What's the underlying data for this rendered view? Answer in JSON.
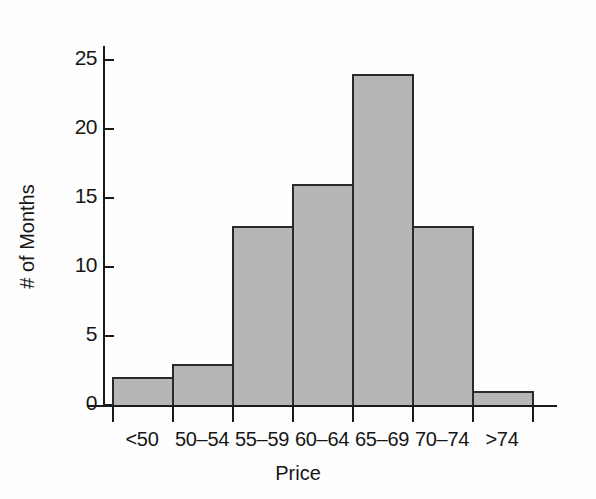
{
  "chart_data": {
    "type": "bar",
    "title": "",
    "subtitle": "",
    "xlabel": "Price",
    "ylabel": "# of Months",
    "categories": [
      "<50",
      "50–54",
      "55–59",
      "60–64",
      "65–69",
      "70–74",
      ">74"
    ],
    "values": [
      2,
      3,
      13,
      16,
      24,
      13,
      1
    ],
    "ylim": [
      0,
      26
    ],
    "yticks": [
      0,
      5,
      10,
      15,
      20,
      25
    ],
    "ytick_labels": [
      "0",
      "5",
      "10",
      "15",
      "20",
      "25"
    ],
    "grid": false,
    "legend": false,
    "legend_position": "none",
    "bar_fill_color": "#b6b6b6",
    "bar_edge_color": "#2a2a2a",
    "axis_color": "#1a1a1a",
    "background_color": "#fefefe",
    "annotations": []
  }
}
